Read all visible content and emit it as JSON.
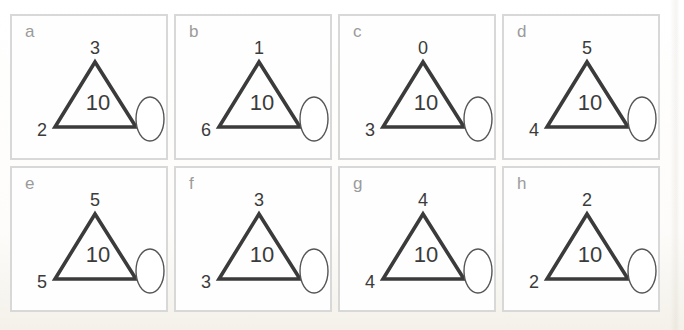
{
  "colors": {
    "panel_border": "#d8d8d8",
    "panel_bg": "#fefefe",
    "letter": "#9b9b9b",
    "number": "#3b3b3b",
    "shape_stroke": "#3b3b3b",
    "oval_stroke": "#555555"
  },
  "worksheet": {
    "panels": [
      {
        "letter": "a",
        "top": "3",
        "left": "2",
        "center": "10"
      },
      {
        "letter": "b",
        "top": "1",
        "left": "6",
        "center": "10"
      },
      {
        "letter": "c",
        "top": "0",
        "left": "3",
        "center": "10"
      },
      {
        "letter": "d",
        "top": "5",
        "left": "4",
        "center": "10"
      },
      {
        "letter": "e",
        "top": "5",
        "left": "5",
        "center": "10"
      },
      {
        "letter": "f",
        "top": "3",
        "left": "3",
        "center": "10"
      },
      {
        "letter": "g",
        "top": "4",
        "left": "4",
        "center": "10"
      },
      {
        "letter": "h",
        "top": "2",
        "left": "2",
        "center": "10"
      }
    ]
  }
}
